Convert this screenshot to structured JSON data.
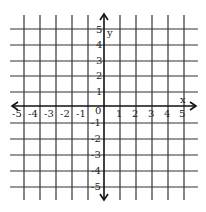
{
  "diagram": {
    "type": "coordinate-plane",
    "x_axis": {
      "label": "x",
      "ticks": [
        "-5",
        "-4",
        "-3",
        "-2",
        "-1",
        "0",
        "1",
        "2",
        "3",
        "4",
        "5"
      ]
    },
    "y_axis": {
      "label": "y",
      "ticks_positive": [
        "1",
        "2",
        "3",
        "4",
        "5"
      ],
      "ticks_negative": [
        "-1",
        "-2",
        "-3",
        "-4",
        "-5"
      ]
    },
    "origin_label": "0",
    "range": {
      "xmin": -5,
      "xmax": 5,
      "ymin": -5,
      "ymax": 5
    },
    "grid_color": "#222222",
    "axis_color": "#111111"
  }
}
